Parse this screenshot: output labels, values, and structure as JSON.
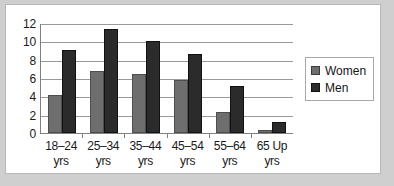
{
  "chart_data": {
    "type": "bar",
    "title": "",
    "xlabel": "",
    "ylabel": "",
    "categories": [
      "18–24 yrs",
      "25–34 yrs",
      "35–44 yrs",
      "45–54 yrs",
      "55–64 yrs",
      "65 Up yrs"
    ],
    "category_lines": [
      [
        "18–24",
        "yrs"
      ],
      [
        "25–34",
        "yrs"
      ],
      [
        "35–44",
        "yrs"
      ],
      [
        "45–54",
        "yrs"
      ],
      [
        "55–64",
        "yrs"
      ],
      [
        "65 Up",
        "yrs"
      ]
    ],
    "series": [
      {
        "name": "Women",
        "color": "#6e6e6e",
        "values": [
          4.1,
          6.8,
          6.4,
          5.8,
          2.3,
          0.3
        ]
      },
      {
        "name": "Men",
        "color": "#2b2b2b",
        "values": [
          9.1,
          11.3,
          10.0,
          8.6,
          5.1,
          1.2
        ]
      }
    ],
    "ylim": [
      0,
      12
    ],
    "yticks": [
      0,
      2,
      4,
      6,
      8,
      10,
      12
    ],
    "ytick_labels": [
      "0",
      "2",
      "4",
      "6",
      "8",
      "10",
      "12"
    ],
    "grid": true,
    "legend_position": "right-outside",
    "legend": [
      "Women",
      "Men"
    ]
  }
}
